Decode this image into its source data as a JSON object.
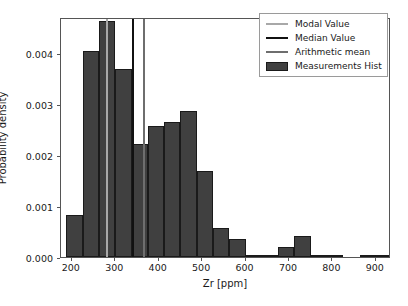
{
  "chart_data": {
    "type": "bar",
    "subtype": "histogram",
    "title": "",
    "xlabel": "Zr [ppm]",
    "ylabel": "Probability density",
    "xlim": [
      175,
      935
    ],
    "ylim": [
      0,
      0.0047
    ],
    "grid": false,
    "legend_position": "upper right",
    "xticks": [
      200,
      300,
      400,
      500,
      600,
      700,
      800,
      900
    ],
    "xtick_labels": [
      "200",
      "300",
      "400",
      "500",
      "600",
      "700",
      "800",
      "900"
    ],
    "yticks": [
      0.0,
      0.001,
      0.002,
      0.003,
      0.004
    ],
    "ytick_labels": [
      "0.000",
      "0.001",
      "0.002",
      "0.003",
      "0.004"
    ],
    "bin_width": 37.5,
    "bin_edges": [
      187.5,
      225,
      262.5,
      300,
      337.5,
      375,
      412.5,
      450,
      487.5,
      525,
      562.5,
      600,
      637.5,
      675,
      712.5,
      750,
      787.5,
      825,
      862.5,
      900,
      937.5
    ],
    "bin_centers": [
      206,
      244,
      281,
      319,
      356,
      394,
      431,
      469,
      506,
      544,
      581,
      619,
      656,
      694,
      731,
      769,
      806,
      844,
      881,
      919
    ],
    "values": [
      0.00082,
      0.00404,
      0.00462,
      0.00368,
      0.00221,
      0.00257,
      0.00264,
      0.00285,
      0.00168,
      0.00057,
      0.00035,
      4e-05,
      4e-05,
      0.0002,
      0.00042,
      4e-05,
      4e-05,
      0.0,
      4e-05,
      4e-05
    ],
    "series": [
      {
        "name": "Measurements Hist",
        "type": "bar",
        "color": "#404040",
        "edge_color": "#1a1a1a",
        "values": [
          0.00082,
          0.00404,
          0.00462,
          0.00368,
          0.00221,
          0.00257,
          0.00264,
          0.00285,
          0.00168,
          0.00057,
          0.00035,
          4e-05,
          4e-05,
          0.0002,
          0.00042,
          4e-05,
          4e-05,
          0.0,
          4e-05,
          4e-05
        ]
      }
    ],
    "vlines": [
      {
        "name": "Modal Value",
        "x": 281,
        "color": "#a8a8a8"
      },
      {
        "name": "Median Value",
        "x": 340,
        "color": "#111111"
      },
      {
        "name": "Arithmetic mean",
        "x": 366,
        "color": "#6e6e6e"
      }
    ],
    "legend_entries": [
      {
        "label": "Modal Value",
        "marker": "line",
        "color": "#a8a8a8"
      },
      {
        "label": "Median Value",
        "marker": "line",
        "color": "#111111"
      },
      {
        "label": "Arithmetic mean",
        "marker": "line",
        "color": "#6e6e6e"
      },
      {
        "label": "Measurements Hist",
        "marker": "patch",
        "color": "#404040"
      }
    ]
  }
}
